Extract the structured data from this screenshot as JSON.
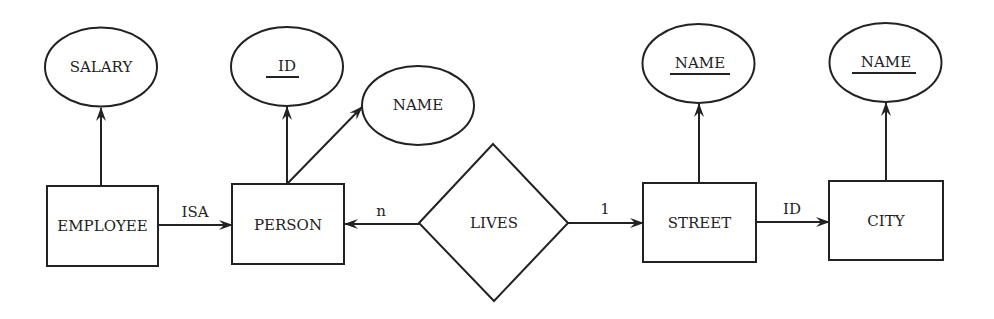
{
  "diagram": {
    "type": "entity-relationship",
    "colors": {
      "ink": "#222222",
      "background": "#ffffff"
    },
    "entities": [
      {
        "id": "employee",
        "label": "EMPLOYEE"
      },
      {
        "id": "person",
        "label": "PERSON"
      },
      {
        "id": "street",
        "label": "STREET"
      },
      {
        "id": "city",
        "label": "CITY"
      }
    ],
    "attributes": [
      {
        "id": "salary",
        "label": "SALARY",
        "owner": "employee",
        "key": false
      },
      {
        "id": "person_id",
        "label": "ID",
        "owner": "person",
        "key": true
      },
      {
        "id": "person_name",
        "label": "NAME",
        "owner": "person",
        "key": false
      },
      {
        "id": "street_name",
        "label": "NAME",
        "owner": "street",
        "key": true
      },
      {
        "id": "city_name",
        "label": "NAME",
        "owner": "city",
        "key": true
      }
    ],
    "relationships": [
      {
        "id": "lives",
        "label": "LIVES"
      }
    ],
    "edges": [
      {
        "id": "isa",
        "from": "employee",
        "to": "person",
        "label": "ISA"
      },
      {
        "id": "lives_person",
        "from": "lives",
        "to": "person",
        "label": "n"
      },
      {
        "id": "lives_street",
        "from": "lives",
        "to": "street",
        "label": "1"
      },
      {
        "id": "street_city",
        "from": "street",
        "to": "city",
        "label": "ID"
      }
    ]
  }
}
